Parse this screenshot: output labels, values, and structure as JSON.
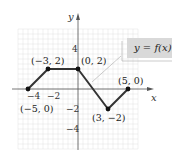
{
  "chart_data": {
    "type": "line",
    "title": "",
    "xlabel": "x",
    "ylabel": "y",
    "xlim": [
      -6,
      6
    ],
    "ylim": [
      -6,
      6
    ],
    "grid": true,
    "x_ticks": [
      -4,
      -2
    ],
    "y_ticks": [
      4,
      -2,
      -4
    ],
    "x_tick_labels": [
      "−4",
      "−2"
    ],
    "y_tick_labels": [
      "4",
      "−2",
      "−4"
    ],
    "series": [
      {
        "name": "y = f(x)",
        "points": [
          [
            -5,
            0
          ],
          [
            -3,
            2
          ],
          [
            0,
            2
          ],
          [
            3,
            -2
          ],
          [
            5,
            0
          ]
        ],
        "color": "#333333"
      }
    ],
    "point_labels": [
      "(−5, 0)",
      "(−3, 2)",
      "(0, 2)",
      "(3, −2)",
      "(5, 0)"
    ],
    "legend": "y = f(x)",
    "legend_position": "upper-right"
  },
  "colors": {
    "grid": "#e2e2e2",
    "axis": "#555555",
    "line": "#333333",
    "legend_fill": "#d9d9d9"
  }
}
